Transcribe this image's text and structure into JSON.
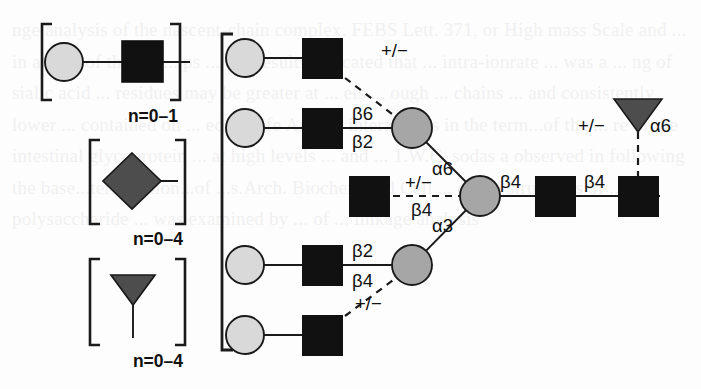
{
  "figure": {
    "type": "glycan-structure-diagram",
    "colors": {
      "square_fill": "#111111",
      "circle_fill": "#d9d9d9",
      "grey_circle_fill": "#a6a6a6",
      "diamond_fill": "#4d4d4d",
      "triangle_fill": "#4d4d4d",
      "stroke": "#1a1a1a",
      "background": "#fdfdfd"
    },
    "repeat_groups": [
      {
        "id": "group-1",
        "shapes": [
          "circle",
          "square"
        ],
        "label": "n=0–1"
      },
      {
        "id": "group-2",
        "shapes": [
          "diamond"
        ],
        "label": "n=0–4"
      },
      {
        "id": "group-3",
        "shapes": [
          "triangle"
        ],
        "label": "n=0–4"
      }
    ],
    "branch_labels": {
      "upper_plusminus": "+/−",
      "beta6": "β6",
      "beta2_upper": "β2",
      "alpha6": "α6",
      "mid_plusminus": "+/−",
      "mid_beta4": "β4",
      "beta4_core1": "β4",
      "beta4_core2": "β4",
      "alpha3": "α3",
      "beta2_lower": "β2",
      "beta4_lower": "β4",
      "lower_plusminus": "+/−",
      "fucose_plusminus": "+/−",
      "fucose_alpha6": "α6"
    },
    "nodes": [
      {
        "name": "branch-1-circle",
        "shape": "circle",
        "x": 245,
        "y": 58
      },
      {
        "name": "branch-1-square",
        "shape": "square",
        "x": 322,
        "y": 58
      },
      {
        "name": "branch-2-circle",
        "shape": "circle",
        "x": 245,
        "y": 128
      },
      {
        "name": "branch-2-square",
        "shape": "square",
        "x": 322,
        "y": 128
      },
      {
        "name": "upper-antenna-mannose",
        "shape": "grey-circle",
        "x": 412,
        "y": 128
      },
      {
        "name": "bisecting-square",
        "shape": "square",
        "x": 370,
        "y": 196
      },
      {
        "name": "core-mannose",
        "shape": "grey-circle",
        "x": 480,
        "y": 196
      },
      {
        "name": "core-square-1",
        "shape": "square",
        "x": 555,
        "y": 196
      },
      {
        "name": "core-square-2",
        "shape": "square",
        "x": 638,
        "y": 196
      },
      {
        "name": "core-fucose",
        "shape": "triangle",
        "x": 638,
        "y": 117
      },
      {
        "name": "branch-3-circle",
        "shape": "circle",
        "x": 245,
        "y": 265
      },
      {
        "name": "branch-3-square",
        "shape": "square",
        "x": 322,
        "y": 265
      },
      {
        "name": "lower-antenna-mannose",
        "shape": "grey-circle",
        "x": 412,
        "y": 265
      },
      {
        "name": "branch-4-circle",
        "shape": "circle",
        "x": 245,
        "y": 335
      },
      {
        "name": "branch-4-square",
        "shape": "square",
        "x": 322,
        "y": 335
      }
    ]
  },
  "background_text": "nge analysis of the nascent-chain complex. FEBS Lett. 371, or High mass Scale and ... in an ion of the M+... ps ... our results indicated that ... intra-ionrate ... was a ... ng of sialic acid ... residues may be greater at ... els ... ough ... chains ... and consistently lower ... contained on ... ed ... Life Are the interactions in the term...of the ... re of the intestinal glycoprotein ... at high levels ... and ... 1.W.C. sodas a observed in following the base...termination...of ...s.Arch. Biochem and Cell ... of the structures of ... polysaccharide ... was examined by ... of ... linkage analysis"
}
